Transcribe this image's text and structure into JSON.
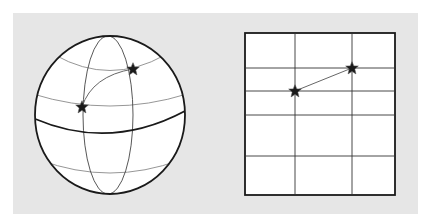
{
  "figure": {
    "background_color": "#e6e6e6",
    "line_color": "#1a1a1a",
    "grid_color": "#333333",
    "latitude_color": "#888888"
  },
  "sphere": {
    "label": "Globe with great-circle path",
    "center": [
      110,
      115
    ],
    "rx": 75,
    "ry": 79,
    "points": [
      {
        "name": "start-point",
        "x": 82,
        "y": 107
      },
      {
        "name": "end-point",
        "x": 133,
        "y": 69
      }
    ]
  },
  "map": {
    "label": "Flat map projection with straight-line path",
    "box": {
      "x": 245,
      "y": 33,
      "width": 150,
      "height": 162
    },
    "vertical_lines_x": [
      295,
      352
    ],
    "horizontal_lines_y": [
      68,
      91,
      115,
      156
    ],
    "points": [
      {
        "name": "start-point",
        "x": 295,
        "y": 91
      },
      {
        "name": "end-point",
        "x": 352,
        "y": 68
      }
    ]
  }
}
